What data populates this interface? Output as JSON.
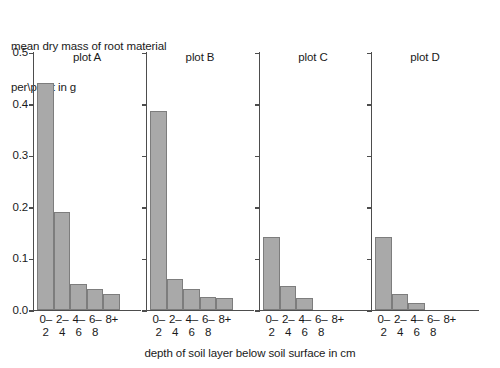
{
  "chart_data": {
    "type": "bar",
    "title": "",
    "ylabel_lines": [
      "mean dry mass of root material",
      "per\\plant in g"
    ],
    "xlabel": "depth of soil layer below soil surface in cm",
    "ylim": [
      0.0,
      0.5
    ],
    "ytick_labels": [
      "0.0",
      "0.1",
      "0.2",
      "0.3",
      "0.4",
      "0.5"
    ],
    "ytick_values": [
      0.0,
      0.1,
      0.2,
      0.3,
      0.4,
      0.5
    ],
    "categories": [
      "0-2",
      "2-4",
      "4-6",
      "6-8",
      "8+"
    ],
    "category_label_lines": [
      [
        "0–",
        "2"
      ],
      [
        "2–",
        "4"
      ],
      [
        "4–",
        "6"
      ],
      [
        "6–",
        "8"
      ],
      [
        "8+",
        ""
      ]
    ],
    "grid": false,
    "legend": "none",
    "panels": [
      {
        "title": "plot A",
        "values": [
          0.44,
          0.19,
          0.05,
          0.04,
          0.03
        ]
      },
      {
        "title": "plot B",
        "values": [
          0.385,
          0.06,
          0.04,
          0.025,
          0.023
        ]
      },
      {
        "title": "plot C",
        "values": [
          0.14,
          0.045,
          0.022,
          0.0,
          0.0
        ]
      },
      {
        "title": "plot D",
        "values": [
          0.14,
          0.03,
          0.012,
          0.0,
          0.0
        ]
      }
    ],
    "colors": {
      "bar_fill": "#a9a9a9",
      "bar_edge": "#7d7d7d",
      "axis": "#4d4d4d",
      "text": "#1a1a1a",
      "background": "#ffffff"
    }
  }
}
